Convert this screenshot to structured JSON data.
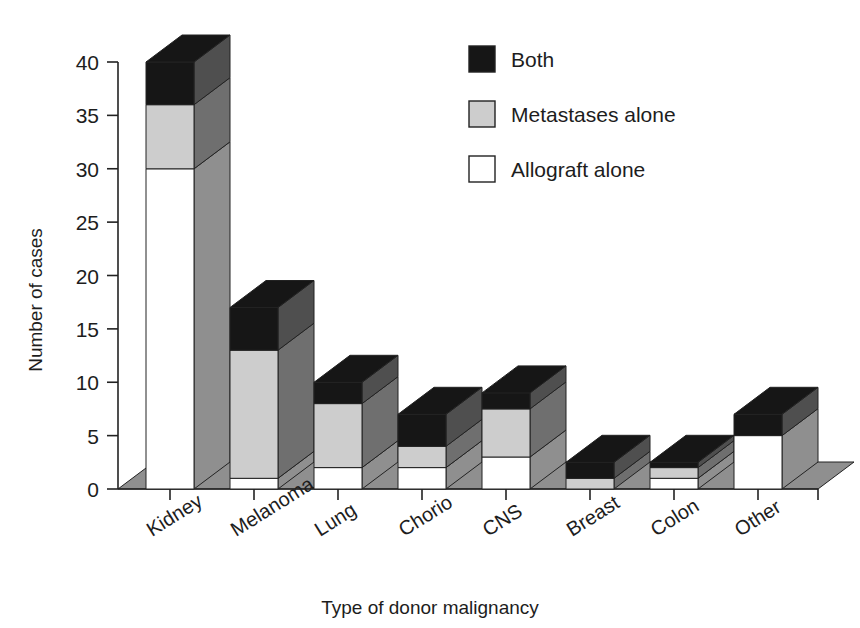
{
  "chart_data": {
    "type": "bar",
    "title": "",
    "subtitle": "",
    "xlabel": "Type of donor malignancy",
    "ylabel": "Number of cases",
    "ylim": [
      0,
      40
    ],
    "yticks": [
      0,
      5,
      10,
      15,
      20,
      25,
      30,
      35,
      40
    ],
    "ytick_labels": [
      "0",
      "5",
      "10",
      "15",
      "20",
      "25",
      "30",
      "35",
      "40"
    ],
    "grid": false,
    "stacked": true,
    "three_d": true,
    "legend_position": "top-right",
    "categories": [
      "Kidney",
      "Melanoma",
      "Lung",
      "Chorio",
      "CNS",
      "Breast",
      "Colon",
      "Other"
    ],
    "series": [
      {
        "name": "Allograft alone",
        "color": "#ffffff",
        "values": [
          30,
          1,
          2,
          2,
          3,
          0,
          1,
          5
        ]
      },
      {
        "name": "Metastases alone",
        "color": "#cdcdcd",
        "values": [
          6,
          12,
          6,
          2,
          4.5,
          1,
          1,
          0
        ]
      },
      {
        "name": "Both",
        "color": "#161616",
        "values": [
          4,
          4,
          2,
          3,
          1.5,
          1.5,
          0.5,
          2
        ]
      }
    ],
    "totals": [
      40,
      17,
      10,
      7,
      9,
      2.5,
      2.5,
      7
    ]
  },
  "legend": {
    "entries": [
      {
        "label": "Both",
        "swatch": "#161616"
      },
      {
        "label": "Metastases alone",
        "swatch": "#cdcdcd"
      },
      {
        "label": "Allograft alone",
        "swatch": "#ffffff"
      }
    ]
  },
  "axes": {
    "y_title": "Number of cases",
    "x_title": "Type of donor malignancy",
    "y_ticks": [
      "40",
      "35",
      "30",
      "25",
      "20",
      "15",
      "10",
      "5",
      "0"
    ],
    "x_categories": [
      "Kidney",
      "Melanoma",
      "Lung",
      "Chorio",
      "CNS",
      "Breast",
      "Colon",
      "Other"
    ]
  },
  "colors": {
    "front_white": "#ffffff",
    "front_light_gray": "#cdcdcd",
    "front_black": "#161616",
    "side_white": "#8f8f8f",
    "side_light_gray": "#6f6f6f",
    "side_black": "#4f4f4f",
    "top_black": "#161616",
    "floor": "#8f8f8f",
    "outline": "#222222",
    "text": "#1d1d1d"
  }
}
